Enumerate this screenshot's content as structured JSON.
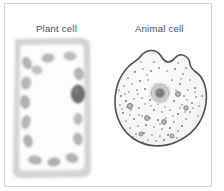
{
  "figure": {
    "background_color": "#ffffff",
    "frame_color": "#d8d8d8"
  },
  "labels": {
    "plant": "Plant cell",
    "animal": "Animal cell",
    "text_color": "#4a4a4a",
    "font_size_px": 9.5
  },
  "plant_cell": {
    "name": "plant-cell",
    "shape": "rounded-rectangle",
    "wall_color": "#dcdcdc",
    "wall_edge_color": "#c9c9c9",
    "cytoplasm_color": "#fbfbfb",
    "organelle_color": "#b0b0b0",
    "organelle_edge_color": "#9a9a9a",
    "nucleus_color": "#6f6f6f",
    "nucleus_position": {
      "cx": 70,
      "cy": 58
    },
    "organelles": [
      {
        "cx": 19,
        "cy": 27,
        "rx": 4.0,
        "ry": 6.0,
        "rot": -20
      },
      {
        "cx": 18,
        "cy": 47,
        "rx": 4.5,
        "ry": 6.0,
        "rot": 10
      },
      {
        "cx": 17,
        "cy": 66,
        "rx": 4.5,
        "ry": 6.5,
        "rot": -8
      },
      {
        "cx": 18,
        "cy": 86,
        "rx": 4.0,
        "ry": 6.5,
        "rot": 12
      },
      {
        "cx": 20,
        "cy": 105,
        "rx": 4.0,
        "ry": 6.0,
        "rot": -15
      },
      {
        "cx": 27,
        "cy": 124,
        "rx": 6.5,
        "ry": 4.0,
        "rot": 8
      },
      {
        "cx": 46,
        "cy": 126,
        "rx": 6.0,
        "ry": 4.0,
        "rot": -6
      },
      {
        "cx": 64,
        "cy": 122,
        "rx": 6.0,
        "ry": 4.2,
        "rot": 14
      },
      {
        "cx": 70,
        "cy": 103,
        "rx": 4.2,
        "ry": 6.0,
        "rot": -10
      },
      {
        "cx": 70,
        "cy": 83,
        "rx": 4.0,
        "ry": 5.5,
        "rot": 6
      },
      {
        "cx": 71,
        "cy": 38,
        "rx": 4.5,
        "ry": 6.0,
        "rot": -12
      },
      {
        "cx": 62,
        "cy": 20,
        "rx": 6.0,
        "ry": 4.0,
        "rot": 5
      },
      {
        "cx": 40,
        "cy": 22,
        "rx": 6.0,
        "ry": 4.0,
        "rot": -8
      },
      {
        "cx": 29,
        "cy": 34,
        "rx": 5.0,
        "ry": 4.0,
        "rot": 18
      }
    ]
  },
  "animal_cell": {
    "name": "animal-cell",
    "shape": "irregular-blob",
    "outline_color": "#4e4e4e",
    "cytoplasm_color": "#f8f8f8",
    "granule_color": "#6b6b6b",
    "nucleus": {
      "cx": 50,
      "cy": 49,
      "outer_r": 11,
      "ring_r": 7.5,
      "nucleolus_r": 4,
      "halo_color": "#d9d9d9",
      "ring_color": "#9b9b9b",
      "nucleolus_color": "#717171"
    },
    "large_granules": [
      {
        "cx": 20,
        "cy": 62,
        "r": 2.6
      },
      {
        "cx": 37,
        "cy": 74,
        "r": 2.4
      },
      {
        "cx": 54,
        "cy": 78,
        "r": 2.4
      },
      {
        "cx": 68,
        "cy": 50,
        "r": 2.5
      },
      {
        "cx": 76,
        "cy": 64,
        "r": 2.2
      },
      {
        "cx": 31,
        "cy": 90,
        "r": 2.0
      },
      {
        "cx": 62,
        "cy": 92,
        "r": 2.0
      }
    ],
    "granule_count": 96
  }
}
